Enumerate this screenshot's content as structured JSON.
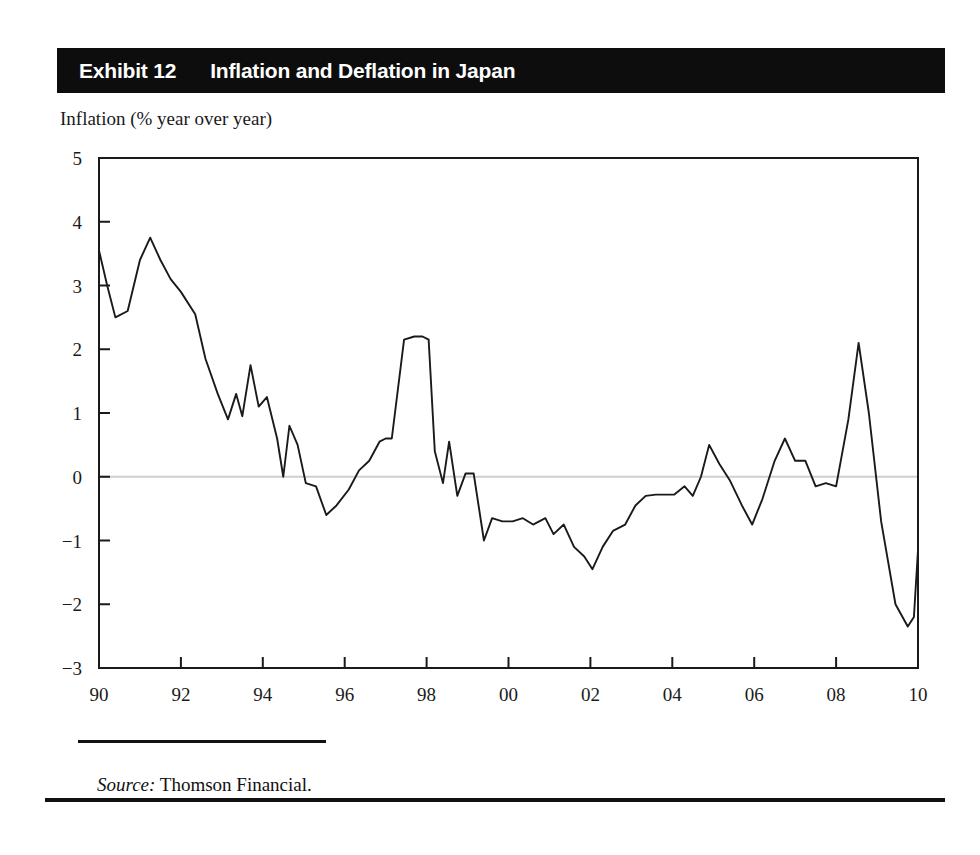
{
  "header": {
    "exhibit_number": "Exhibit 12",
    "exhibit_title": "Inflation and Deflation in Japan",
    "background_color": "#0d0d0d",
    "text_color": "#ffffff"
  },
  "axis_caption": "Inflation (% year over year)",
  "source": {
    "label": "Source:",
    "text": " Thomson Financial."
  },
  "chart_data": {
    "type": "line",
    "title": "Inflation and Deflation in Japan",
    "subtitle": "Inflation (% year over year)",
    "xlabel": "",
    "ylabel": "Inflation (% year over year)",
    "xlim": [
      1990,
      2010
    ],
    "ylim": [
      -3,
      5
    ],
    "grid": false,
    "zero_line": true,
    "zero_line_color": "#cfcfcf",
    "line_color": "#1a1a1a",
    "legend": null,
    "xticks": [
      1990,
      1992,
      1994,
      1996,
      1998,
      2000,
      2002,
      2004,
      2006,
      2008,
      2010
    ],
    "xtick_labels": [
      "90",
      "92",
      "94",
      "96",
      "98",
      "00",
      "02",
      "04",
      "06",
      "08",
      "10"
    ],
    "yticks": [
      -3,
      -2,
      -1,
      0,
      1,
      2,
      3,
      4,
      5
    ],
    "ytick_labels": [
      "−3",
      "−2",
      "−1",
      "0",
      "1",
      "2",
      "3",
      "4",
      "5"
    ],
    "series": [
      {
        "name": "Japan CPI inflation",
        "x": [
          1990.0,
          1990.2,
          1990.4,
          1990.7,
          1991.0,
          1991.25,
          1991.5,
          1991.75,
          1992.0,
          1992.35,
          1992.6,
          1992.9,
          1993.15,
          1993.35,
          1993.5,
          1993.7,
          1993.9,
          1994.1,
          1994.35,
          1994.5,
          1994.65,
          1994.85,
          1995.05,
          1995.3,
          1995.55,
          1995.8,
          1996.1,
          1996.35,
          1996.6,
          1996.85,
          1997.0,
          1997.15,
          1997.45,
          1997.7,
          1997.9,
          1998.05,
          1998.2,
          1998.4,
          1998.55,
          1998.75,
          1998.95,
          1999.15,
          1999.4,
          1999.6,
          1999.85,
          2000.1,
          2000.35,
          2000.6,
          2000.9,
          2001.1,
          2001.35,
          2001.6,
          2001.85,
          2002.05,
          2002.3,
          2002.55,
          2002.85,
          2003.1,
          2003.35,
          2003.6,
          2003.85,
          2004.05,
          2004.3,
          2004.5,
          2004.7,
          2004.9,
          2005.15,
          2005.4,
          2005.7,
          2005.95,
          2006.2,
          2006.5,
          2006.75,
          2007.0,
          2007.25,
          2007.5,
          2007.75,
          2008.0,
          2008.3,
          2008.55,
          2008.8,
          2009.1,
          2009.45,
          2009.75,
          2009.9,
          2010.0
        ],
        "y": [
          3.55,
          3.0,
          2.5,
          2.6,
          3.4,
          3.75,
          3.4,
          3.1,
          2.9,
          2.55,
          1.85,
          1.3,
          0.9,
          1.3,
          0.95,
          1.75,
          1.1,
          1.25,
          0.6,
          0.0,
          0.8,
          0.5,
          -0.1,
          -0.15,
          -0.6,
          -0.45,
          -0.2,
          0.1,
          0.25,
          0.55,
          0.6,
          0.6,
          2.15,
          2.2,
          2.2,
          2.15,
          0.4,
          -0.1,
          0.55,
          -0.3,
          0.05,
          0.05,
          -1.0,
          -0.65,
          -0.7,
          -0.7,
          -0.65,
          -0.75,
          -0.65,
          -0.9,
          -0.75,
          -1.1,
          -1.25,
          -1.45,
          -1.1,
          -0.85,
          -0.75,
          -0.45,
          -0.3,
          -0.28,
          -0.28,
          -0.28,
          -0.15,
          -0.3,
          0.0,
          0.5,
          0.2,
          -0.05,
          -0.45,
          -0.75,
          -0.35,
          0.25,
          0.6,
          0.25,
          0.25,
          -0.15,
          -0.1,
          -0.15,
          0.9,
          2.1,
          1.0,
          -0.7,
          -2.0,
          -2.35,
          -2.2,
          -1.15
        ]
      }
    ],
    "annotations": []
  }
}
